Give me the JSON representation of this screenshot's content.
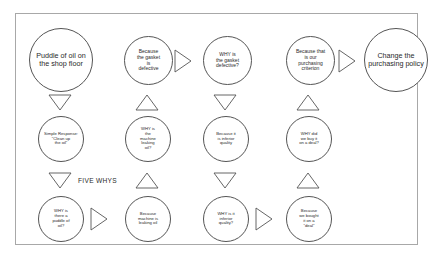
{
  "diagram": {
    "title": "Five Whys",
    "caption_label": "FIVE WHYS",
    "stroke_color": "#555555",
    "frame_color": "#a8a8a8",
    "background": "#ffffff",
    "text_color": "#2a2a2a"
  },
  "nodes": {
    "problem": "Puddle of oil on the shop floor",
    "simple_response": "Simple Response:\n\"Clean up\nthe oil\"",
    "why1": "WHY is\nthere a\npuddle of\noil?",
    "because1": "Because\nmachine is\nleaking oil",
    "why2": "WHY is\nthe\nmachine\nleaking\noil?",
    "because2": "Because\nthe gasket\nis\ndefective",
    "why3": "WHY is\nthe gasket\ndefective?",
    "because3": "Because it\nis inferior\nquality",
    "why4": "WHY is it\ninferior\nquality?",
    "because4": "Because\nwe bought\nit on a\n\"deal\"",
    "why5": "WHY did\nwe buy it\non a deal?",
    "because5": "Because that\nis our\npurchasing\ncriterion",
    "conclusion": "Change the purchasing policy"
  },
  "connectors": [
    {
      "id": "c1",
      "name": "arrow-down-problem-to-response",
      "direction": "down"
    },
    {
      "id": "c2",
      "name": "arrow-down-response-to-why1",
      "direction": "down"
    },
    {
      "id": "c3",
      "name": "arrow-right-why1-to-because1",
      "direction": "right"
    },
    {
      "id": "c4",
      "name": "arrow-up-because1-to-why2",
      "direction": "up"
    },
    {
      "id": "c5",
      "name": "arrow-up-why2-to-because2",
      "direction": "up"
    },
    {
      "id": "c6",
      "name": "arrow-right-because2-to-why3",
      "direction": "right"
    },
    {
      "id": "c7",
      "name": "arrow-down-why3-to-because3",
      "direction": "down"
    },
    {
      "id": "c8",
      "name": "arrow-down-because3-to-why4",
      "direction": "down"
    },
    {
      "id": "c9",
      "name": "arrow-right-why4-to-because4",
      "direction": "right"
    },
    {
      "id": "c10",
      "name": "arrow-up-because4-to-why5",
      "direction": "up"
    },
    {
      "id": "c11",
      "name": "arrow-up-why5-to-because5",
      "direction": "up"
    },
    {
      "id": "c12",
      "name": "arrow-right-because5-to-conclusion",
      "direction": "right"
    }
  ]
}
